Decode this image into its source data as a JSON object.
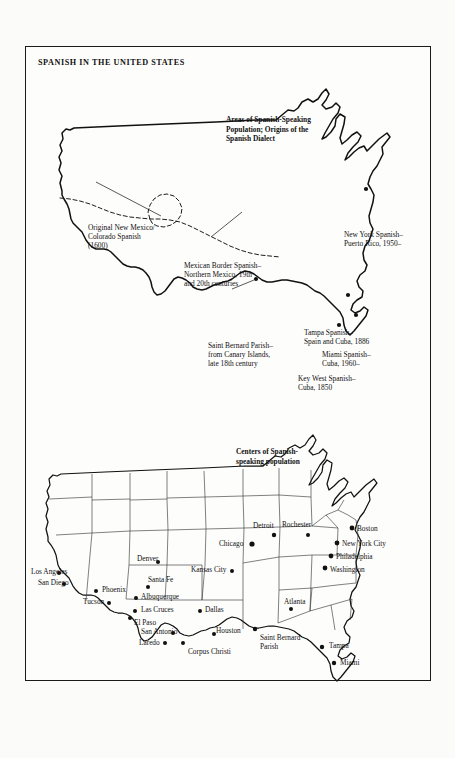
{
  "document": {
    "title": "SPANISH IN THE UNITED STATES"
  },
  "map_top": {
    "caption": "Areas of Spanish-Speaking\nPopulation; Origins of the\nSpanish Dialect",
    "annotations": [
      {
        "name": "new-mexico-colorado",
        "heading": "Original New Mexico/",
        "lines": "Colorado Spanish\n(1600)"
      },
      {
        "name": "mexican-border",
        "heading": "Mexican Border Spanish–",
        "lines": "Northern Mexico, 19th\nand 20th centuries"
      },
      {
        "name": "saint-bernard-parish",
        "heading": "Saint Bernard Parish–",
        "lines": "from Canary Islands,\nlate 18th century"
      },
      {
        "name": "new-york",
        "heading": "New York Spanish–",
        "lines": "Puerto Rico, 1950–"
      },
      {
        "name": "tampa",
        "heading": "Tampa Spanish–",
        "lines": "Spain and Cuba, 1886"
      },
      {
        "name": "miami",
        "heading": "Miami Spanish–",
        "lines": "Cuba, 1960–"
      },
      {
        "name": "key-west",
        "heading": "Key West Spanish–",
        "lines": "Cuba, 1850"
      }
    ]
  },
  "map_bottom": {
    "caption": "Centers of Spanish-\nspeaking population",
    "cities": [
      {
        "name": "los-angeles",
        "label": "Los Angeles"
      },
      {
        "name": "san-diego",
        "label": "San Diego"
      },
      {
        "name": "phoenix",
        "label": "Phoenix"
      },
      {
        "name": "tucson",
        "label": "Tucson"
      },
      {
        "name": "santa-fe",
        "label": "Santa Fe"
      },
      {
        "name": "albuquerque",
        "label": "Albuquerque"
      },
      {
        "name": "las-cruces",
        "label": "Las Cruces"
      },
      {
        "name": "el-paso",
        "label": "El Paso"
      },
      {
        "name": "denver",
        "label": "Denver"
      },
      {
        "name": "kansas-city",
        "label": "Kansas City"
      },
      {
        "name": "dallas",
        "label": "Dallas"
      },
      {
        "name": "san-antonio",
        "label": "San Antonio"
      },
      {
        "name": "laredo",
        "label": "Laredo"
      },
      {
        "name": "corpus-christi",
        "label": "Corpus Christi"
      },
      {
        "name": "houston",
        "label": "Houston"
      },
      {
        "name": "saint-bernard-parish",
        "label": "Saint Bernard\nParish"
      },
      {
        "name": "atlanta",
        "label": "Atlanta"
      },
      {
        "name": "tampa",
        "label": "Tampa"
      },
      {
        "name": "miami",
        "label": "Miami"
      },
      {
        "name": "chicago",
        "label": "Chicago"
      },
      {
        "name": "detroit",
        "label": "Detroit"
      },
      {
        "name": "rochester",
        "label": "Rochester"
      },
      {
        "name": "boston",
        "label": "Boston"
      },
      {
        "name": "new-york-city",
        "label": "New York City"
      },
      {
        "name": "philadelphia",
        "label": "Philadelphia"
      },
      {
        "name": "washington",
        "label": "Washington"
      }
    ]
  },
  "colors": {
    "ink": "#111111",
    "paper": "#fdfdfc",
    "state_line": "#333333"
  }
}
